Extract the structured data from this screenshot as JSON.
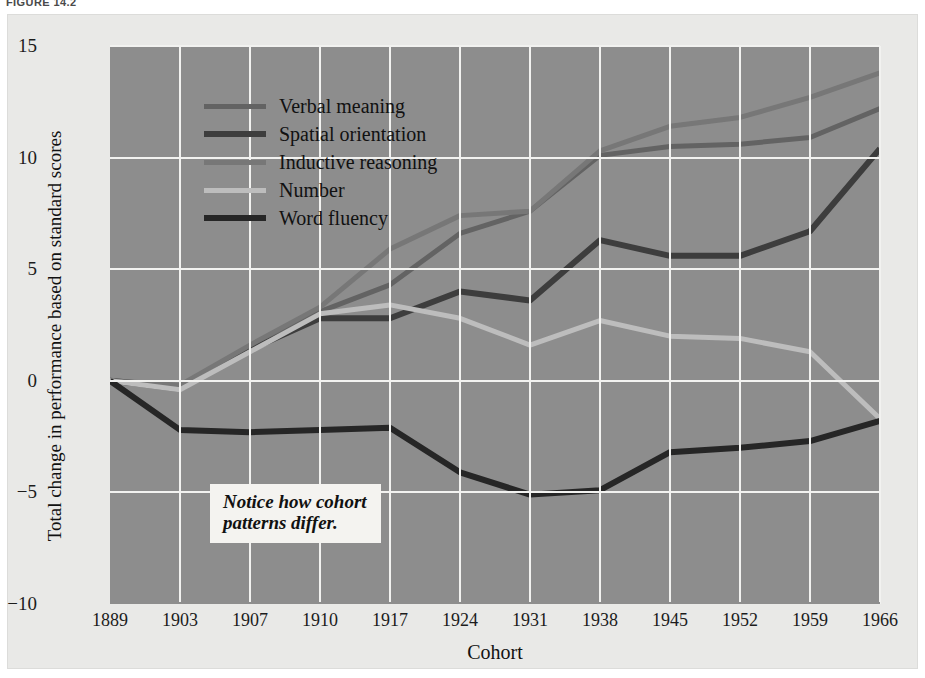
{
  "figure": {
    "label": "FIGURE 14.2"
  },
  "annotation": {
    "text": "Notice how cohort\npatterns differ."
  },
  "chart_data": {
    "type": "line",
    "title": "",
    "xlabel": "Cohort",
    "ylabel": "Total change in performance based on standard scores",
    "categories": [
      "1889",
      "1903",
      "1907",
      "1910",
      "1917",
      "1924",
      "1931",
      "1938",
      "1945",
      "1952",
      "1959",
      "1966"
    ],
    "x": [
      1889,
      1903,
      1907,
      1910,
      1917,
      1924,
      1931,
      1938,
      1945,
      1952,
      1959,
      1966
    ],
    "ylim": [
      -10,
      15
    ],
    "yticks": [
      15,
      10,
      5,
      0,
      -5,
      -10
    ],
    "ytick_labels": [
      "15",
      "10",
      "5",
      "0",
      "−5",
      "−10"
    ],
    "grid": true,
    "legend_position": "upper-left-inside",
    "series": [
      {
        "name": "Verbal meaning",
        "color": "#636363",
        "width": 5,
        "values": [
          0,
          -0.4,
          1.5,
          3.1,
          4.3,
          6.6,
          7.6,
          10.1,
          10.5,
          10.6,
          10.9,
          12.2
        ]
      },
      {
        "name": "Spatial orientation",
        "color": "#3d3d3d",
        "width": 6,
        "values": [
          0,
          -0.3,
          1.4,
          2.8,
          2.8,
          4.0,
          3.6,
          6.3,
          5.6,
          5.6,
          6.7,
          10.4
        ]
      },
      {
        "name": "Inductive reasoning",
        "color": "#777777",
        "width": 5,
        "values": [
          0,
          -0.2,
          1.6,
          3.3,
          5.9,
          7.4,
          7.6,
          10.3,
          11.4,
          11.8,
          12.7,
          13.8
        ]
      },
      {
        "name": "Number",
        "color": "#bdbdbd",
        "width": 5,
        "values": [
          0,
          -0.4,
          1.3,
          3.0,
          3.4,
          2.8,
          1.6,
          2.7,
          2.0,
          1.9,
          1.3,
          -1.7
        ]
      },
      {
        "name": "Word fluency",
        "color": "#262626",
        "width": 6,
        "values": [
          0,
          -2.2,
          -2.3,
          -2.2,
          -2.1,
          -4.1,
          -5.1,
          -4.9,
          -3.2,
          -3.0,
          -2.7,
          -1.8
        ]
      }
    ]
  }
}
